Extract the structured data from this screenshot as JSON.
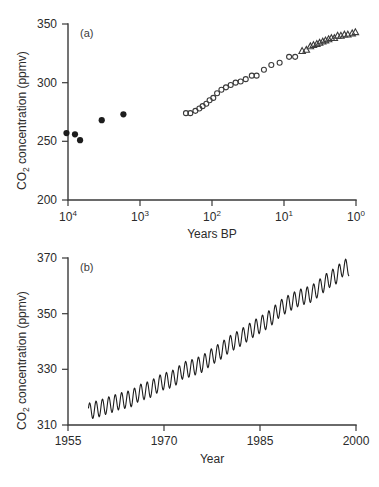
{
  "figure": {
    "background": "#ffffff",
    "ink_color": "#2b2b2b"
  },
  "panel_a": {
    "label": "(a)",
    "xlabel": "Years BP",
    "ylabel_main": "CO",
    "ylabel_sub": "2",
    "ylabel_rest": " concentration (ppmv)",
    "ylabel_full": "CO2 concentration (ppmv)",
    "x_ticks": [
      {
        "base": "10",
        "exp": "4",
        "value": 10000
      },
      {
        "base": "10",
        "exp": "3",
        "value": 1000
      },
      {
        "base": "10",
        "exp": "2",
        "value": 100
      },
      {
        "base": "10",
        "exp": "1",
        "value": 10
      },
      {
        "base": "10",
        "exp": "0",
        "value": 1
      }
    ],
    "y_ticks": [
      "200",
      "250",
      "300",
      "350"
    ]
  },
  "panel_b": {
    "label": "(b)",
    "xlabel": "Year",
    "ylabel_main": "CO",
    "ylabel_sub": "2",
    "ylabel_rest": " concentration (ppmv)",
    "ylabel_full": "CO2 concentration (ppmv)",
    "x_ticks": [
      "1955",
      "1970",
      "1985",
      "2000"
    ],
    "y_ticks": [
      "310",
      "330",
      "350",
      "370"
    ]
  },
  "chart_data": [
    {
      "type": "scatter",
      "panel": "(a)",
      "title": "",
      "xlabel": "Years BP",
      "ylabel": "CO2 concentration (ppmv)",
      "xscale": "log",
      "x_reversed": true,
      "xlim": [
        10000,
        1
      ],
      "ylim": [
        190,
        352
      ],
      "x_tick_values": [
        10000,
        1000,
        100,
        10,
        1
      ],
      "x_tick_labels": [
        "10^4",
        "10^3",
        "10^2",
        "10^1",
        "10^0"
      ],
      "y_tick_values": [
        200,
        250,
        300,
        350
      ],
      "y_tick_labels": [
        "200",
        "250",
        "300",
        "350"
      ],
      "grid": false,
      "legend": false,
      "series": [
        {
          "name": "ice-core (filled circles)",
          "marker": "filled-circle",
          "color": "#1d1d1d",
          "points": [
            {
              "x": 10500,
              "y": 257
            },
            {
              "x": 8000,
              "y": 256
            },
            {
              "x": 6800,
              "y": 251
            },
            {
              "x": 3400,
              "y": 268
            },
            {
              "x": 1700,
              "y": 273
            }
          ]
        },
        {
          "name": "ice-core recent (open circles)",
          "marker": "open-circle",
          "color": "#3b3b3b",
          "points": [
            {
              "x": 230,
              "y": 274
            },
            {
              "x": 200,
              "y": 274
            },
            {
              "x": 170,
              "y": 276
            },
            {
              "x": 150,
              "y": 278
            },
            {
              "x": 135,
              "y": 280
            },
            {
              "x": 120,
              "y": 282
            },
            {
              "x": 108,
              "y": 285
            },
            {
              "x": 96,
              "y": 287
            },
            {
              "x": 85,
              "y": 291
            },
            {
              "x": 74,
              "y": 294
            },
            {
              "x": 64,
              "y": 296
            },
            {
              "x": 55,
              "y": 298
            },
            {
              "x": 47,
              "y": 300
            },
            {
              "x": 40,
              "y": 301
            },
            {
              "x": 34,
              "y": 303
            },
            {
              "x": 28,
              "y": 306
            },
            {
              "x": 24,
              "y": 306
            },
            {
              "x": 19,
              "y": 311
            },
            {
              "x": 15,
              "y": 315
            },
            {
              "x": 11.5,
              "y": 317
            },
            {
              "x": 8.5,
              "y": 322
            },
            {
              "x": 7.0,
              "y": 322
            }
          ]
        },
        {
          "name": "Mauna Loa (open triangles)",
          "marker": "open-triangle",
          "color": "#3b3b3b",
          "points": [
            {
              "x": 5.6,
              "y": 327
            },
            {
              "x": 4.9,
              "y": 328
            },
            {
              "x": 4.3,
              "y": 331
            },
            {
              "x": 3.9,
              "y": 332
            },
            {
              "x": 3.5,
              "y": 333
            },
            {
              "x": 3.2,
              "y": 334
            },
            {
              "x": 2.9,
              "y": 335
            },
            {
              "x": 2.65,
              "y": 336
            },
            {
              "x": 2.4,
              "y": 337
            },
            {
              "x": 2.2,
              "y": 338
            },
            {
              "x": 2.0,
              "y": 338
            },
            {
              "x": 1.8,
              "y": 340
            },
            {
              "x": 1.62,
              "y": 340
            },
            {
              "x": 1.45,
              "y": 341
            },
            {
              "x": 1.3,
              "y": 341
            },
            {
              "x": 1.13,
              "y": 342
            },
            {
              "x": 1.02,
              "y": 343
            }
          ]
        }
      ]
    },
    {
      "type": "line",
      "panel": "(b)",
      "title": "",
      "xlabel": "Year",
      "ylabel": "CO2 concentration (ppmv)",
      "xscale": "linear",
      "xlim": [
        1955,
        2000
      ],
      "ylim": [
        310,
        370
      ],
      "x_tick_values": [
        1955,
        1970,
        1985,
        2000
      ],
      "x_tick_labels": [
        "1955",
        "1970",
        "1985",
        "2000"
      ],
      "y_tick_values": [
        310,
        330,
        350,
        370
      ],
      "y_tick_labels": [
        "310",
        "330",
        "350",
        "370"
      ],
      "grid": false,
      "legend": false,
      "description": "Mauna Loa monthly CO2 record with seasonal sawtooth oscillation superimposed on a rising trend",
      "series": [
        {
          "name": "Mauna Loa monthly CO2",
          "color": "#1d1d1d",
          "data_start_year": 1958.2,
          "data_end_year": 1998.9,
          "trend_start_ppmv": 314.5,
          "trend_end_ppmv": 362.5,
          "seasonal_amplitude_ppmv": 3.0,
          "annual_points": [
            {
              "year": 1958,
              "value": 314.7
            },
            {
              "year": 1959,
              "value": 315.4
            },
            {
              "year": 1960,
              "value": 316.0
            },
            {
              "year": 1961,
              "value": 316.9
            },
            {
              "year": 1962,
              "value": 317.6
            },
            {
              "year": 1963,
              "value": 318.5
            },
            {
              "year": 1964,
              "value": 319.0
            },
            {
              "year": 1965,
              "value": 319.6
            },
            {
              "year": 1966,
              "value": 321.4
            },
            {
              "year": 1967,
              "value": 322.2
            },
            {
              "year": 1968,
              "value": 323.0
            },
            {
              "year": 1969,
              "value": 324.6
            },
            {
              "year": 1970,
              "value": 325.7
            },
            {
              "year": 1971,
              "value": 326.3
            },
            {
              "year": 1972,
              "value": 327.5
            },
            {
              "year": 1973,
              "value": 329.7
            },
            {
              "year": 1974,
              "value": 330.2
            },
            {
              "year": 1975,
              "value": 331.1
            },
            {
              "year": 1976,
              "value": 332.0
            },
            {
              "year": 1977,
              "value": 333.8
            },
            {
              "year": 1978,
              "value": 335.4
            },
            {
              "year": 1979,
              "value": 336.8
            },
            {
              "year": 1980,
              "value": 338.7
            },
            {
              "year": 1981,
              "value": 340.1
            },
            {
              "year": 1982,
              "value": 341.4
            },
            {
              "year": 1983,
              "value": 343.0
            },
            {
              "year": 1984,
              "value": 344.6
            },
            {
              "year": 1985,
              "value": 346.0
            },
            {
              "year": 1986,
              "value": 347.4
            },
            {
              "year": 1987,
              "value": 349.2
            },
            {
              "year": 1988,
              "value": 351.6
            },
            {
              "year": 1989,
              "value": 353.1
            },
            {
              "year": 1990,
              "value": 354.4
            },
            {
              "year": 1991,
              "value": 355.6
            },
            {
              "year": 1992,
              "value": 356.4
            },
            {
              "year": 1993,
              "value": 357.1
            },
            {
              "year": 1994,
              "value": 358.8
            },
            {
              "year": 1995,
              "value": 360.8
            },
            {
              "year": 1996,
              "value": 362.6
            },
            {
              "year": 1997,
              "value": 363.8
            },
            {
              "year": 1998,
              "value": 366.6
            }
          ]
        }
      ]
    }
  ]
}
